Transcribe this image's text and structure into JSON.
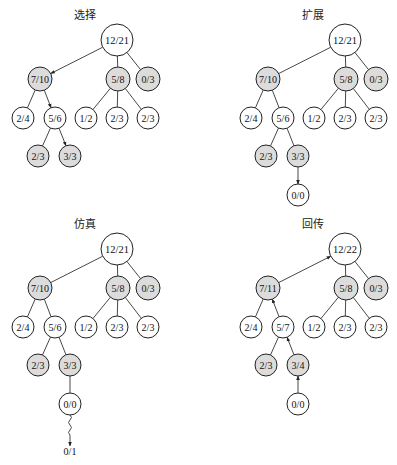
{
  "colors": {
    "shaded": "#dcdcdc",
    "plain": "#ffffff",
    "stroke": "#222222",
    "edge": "#333333"
  },
  "panels": [
    {
      "id": "selection",
      "title": "选择",
      "offset": [
        0,
        0
      ],
      "nodes": [
        {
          "id": "root",
          "label": "12/21",
          "x": 117,
          "y": 40,
          "r": 16,
          "shaded": false
        },
        {
          "id": "a",
          "label": "7/10",
          "x": 40,
          "y": 79,
          "r": 12,
          "shaded": true
        },
        {
          "id": "b",
          "label": "5/8",
          "x": 118,
          "y": 79,
          "r": 12,
          "shaded": true
        },
        {
          "id": "c",
          "label": "0/3",
          "x": 148,
          "y": 79,
          "r": 12,
          "shaded": true
        },
        {
          "id": "a1",
          "label": "2/4",
          "x": 23,
          "y": 118,
          "r": 11,
          "shaded": false
        },
        {
          "id": "a2",
          "label": "5/6",
          "x": 55,
          "y": 118,
          "r": 11,
          "shaded": false
        },
        {
          "id": "b1",
          "label": "1/2",
          "x": 86,
          "y": 118,
          "r": 11,
          "shaded": false
        },
        {
          "id": "b2",
          "label": "2/3",
          "x": 117,
          "y": 118,
          "r": 11,
          "shaded": false
        },
        {
          "id": "b3",
          "label": "2/3",
          "x": 148,
          "y": 118,
          "r": 11,
          "shaded": false
        },
        {
          "id": "a21",
          "label": "2/3",
          "x": 38,
          "y": 156,
          "r": 11,
          "shaded": true
        },
        {
          "id": "a22",
          "label": "3/3",
          "x": 70,
          "y": 156,
          "r": 11,
          "shaded": true
        }
      ],
      "edges": [
        {
          "from": "root",
          "to": "a",
          "arrow": "to"
        },
        {
          "from": "root",
          "to": "b",
          "arrow": "none"
        },
        {
          "from": "root",
          "to": "c",
          "arrow": "none"
        },
        {
          "from": "a",
          "to": "a1",
          "arrow": "none"
        },
        {
          "from": "a",
          "to": "a2",
          "arrow": "to"
        },
        {
          "from": "b",
          "to": "b1",
          "arrow": "none"
        },
        {
          "from": "b",
          "to": "b2",
          "arrow": "none"
        },
        {
          "from": "b",
          "to": "b3",
          "arrow": "none"
        },
        {
          "from": "a2",
          "to": "a21",
          "arrow": "none"
        },
        {
          "from": "a2",
          "to": "a22",
          "arrow": "to"
        }
      ]
    },
    {
      "id": "expansion",
      "title": "扩展",
      "offset": [
        228,
        0
      ],
      "nodes": [
        {
          "id": "root",
          "label": "12/21",
          "x": 117,
          "y": 40,
          "r": 16,
          "shaded": false
        },
        {
          "id": "a",
          "label": "7/10",
          "x": 40,
          "y": 79,
          "r": 12,
          "shaded": true
        },
        {
          "id": "b",
          "label": "5/8",
          "x": 118,
          "y": 79,
          "r": 12,
          "shaded": true
        },
        {
          "id": "c",
          "label": "0/3",
          "x": 148,
          "y": 79,
          "r": 12,
          "shaded": true
        },
        {
          "id": "a1",
          "label": "2/4",
          "x": 23,
          "y": 118,
          "r": 11,
          "shaded": false
        },
        {
          "id": "a2",
          "label": "5/6",
          "x": 55,
          "y": 118,
          "r": 11,
          "shaded": false
        },
        {
          "id": "b1",
          "label": "1/2",
          "x": 86,
          "y": 118,
          "r": 11,
          "shaded": false
        },
        {
          "id": "b2",
          "label": "2/3",
          "x": 117,
          "y": 118,
          "r": 11,
          "shaded": false
        },
        {
          "id": "b3",
          "label": "2/3",
          "x": 148,
          "y": 118,
          "r": 11,
          "shaded": false
        },
        {
          "id": "a21",
          "label": "2/3",
          "x": 38,
          "y": 156,
          "r": 11,
          "shaded": true
        },
        {
          "id": "a22",
          "label": "3/3",
          "x": 70,
          "y": 156,
          "r": 11,
          "shaded": true
        },
        {
          "id": "new",
          "label": "0/0",
          "x": 70,
          "y": 195,
          "r": 11,
          "shaded": false
        }
      ],
      "edges": [
        {
          "from": "root",
          "to": "a",
          "arrow": "none"
        },
        {
          "from": "root",
          "to": "b",
          "arrow": "none"
        },
        {
          "from": "root",
          "to": "c",
          "arrow": "none"
        },
        {
          "from": "a",
          "to": "a1",
          "arrow": "none"
        },
        {
          "from": "a",
          "to": "a2",
          "arrow": "none"
        },
        {
          "from": "b",
          "to": "b1",
          "arrow": "none"
        },
        {
          "from": "b",
          "to": "b2",
          "arrow": "none"
        },
        {
          "from": "b",
          "to": "b3",
          "arrow": "none"
        },
        {
          "from": "a2",
          "to": "a21",
          "arrow": "none"
        },
        {
          "from": "a2",
          "to": "a22",
          "arrow": "none"
        },
        {
          "from": "a22",
          "to": "new",
          "arrow": "to"
        }
      ]
    },
    {
      "id": "simulation",
      "title": "仿真",
      "offset": [
        0,
        209
      ],
      "nodes": [
        {
          "id": "root",
          "label": "12/21",
          "x": 117,
          "y": 40,
          "r": 16,
          "shaded": false
        },
        {
          "id": "a",
          "label": "7/10",
          "x": 40,
          "y": 79,
          "r": 12,
          "shaded": true
        },
        {
          "id": "b",
          "label": "5/8",
          "x": 118,
          "y": 79,
          "r": 12,
          "shaded": true
        },
        {
          "id": "c",
          "label": "0/3",
          "x": 148,
          "y": 79,
          "r": 12,
          "shaded": true
        },
        {
          "id": "a1",
          "label": "2/4",
          "x": 23,
          "y": 118,
          "r": 11,
          "shaded": false
        },
        {
          "id": "a2",
          "label": "5/6",
          "x": 55,
          "y": 118,
          "r": 11,
          "shaded": false
        },
        {
          "id": "b1",
          "label": "1/2",
          "x": 86,
          "y": 118,
          "r": 11,
          "shaded": false
        },
        {
          "id": "b2",
          "label": "2/3",
          "x": 117,
          "y": 118,
          "r": 11,
          "shaded": false
        },
        {
          "id": "b3",
          "label": "2/3",
          "x": 148,
          "y": 118,
          "r": 11,
          "shaded": false
        },
        {
          "id": "a21",
          "label": "2/3",
          "x": 38,
          "y": 156,
          "r": 11,
          "shaded": true
        },
        {
          "id": "a22",
          "label": "3/3",
          "x": 70,
          "y": 156,
          "r": 11,
          "shaded": true
        },
        {
          "id": "new",
          "label": "0/0",
          "x": 70,
          "y": 195,
          "r": 11,
          "shaded": false
        }
      ],
      "edges": [
        {
          "from": "root",
          "to": "a",
          "arrow": "none"
        },
        {
          "from": "root",
          "to": "b",
          "arrow": "none"
        },
        {
          "from": "root",
          "to": "c",
          "arrow": "none"
        },
        {
          "from": "a",
          "to": "a1",
          "arrow": "none"
        },
        {
          "from": "a",
          "to": "a2",
          "arrow": "none"
        },
        {
          "from": "b",
          "to": "b1",
          "arrow": "none"
        },
        {
          "from": "b",
          "to": "b2",
          "arrow": "none"
        },
        {
          "from": "b",
          "to": "b3",
          "arrow": "none"
        },
        {
          "from": "a2",
          "to": "a21",
          "arrow": "none"
        },
        {
          "from": "a2",
          "to": "a22",
          "arrow": "none"
        },
        {
          "from": "a22",
          "to": "new",
          "arrow": "none"
        }
      ],
      "rollout": {
        "from": "new",
        "label": "0/1",
        "end_y": 237,
        "label_y": 246
      }
    },
    {
      "id": "backpropagation",
      "title": "回传",
      "offset": [
        228,
        209
      ],
      "nodes": [
        {
          "id": "root",
          "label": "12/22",
          "x": 117,
          "y": 40,
          "r": 16,
          "shaded": false
        },
        {
          "id": "a",
          "label": "7/11",
          "x": 40,
          "y": 79,
          "r": 12,
          "shaded": true
        },
        {
          "id": "b",
          "label": "5/8",
          "x": 118,
          "y": 79,
          "r": 12,
          "shaded": true
        },
        {
          "id": "c",
          "label": "0/3",
          "x": 148,
          "y": 79,
          "r": 12,
          "shaded": true
        },
        {
          "id": "a1",
          "label": "2/4",
          "x": 23,
          "y": 118,
          "r": 11,
          "shaded": false
        },
        {
          "id": "a2",
          "label": "5/7",
          "x": 55,
          "y": 118,
          "r": 11,
          "shaded": false
        },
        {
          "id": "b1",
          "label": "1/2",
          "x": 86,
          "y": 118,
          "r": 11,
          "shaded": false
        },
        {
          "id": "b2",
          "label": "2/3",
          "x": 117,
          "y": 118,
          "r": 11,
          "shaded": false
        },
        {
          "id": "b3",
          "label": "2/3",
          "x": 148,
          "y": 118,
          "r": 11,
          "shaded": false
        },
        {
          "id": "a21",
          "label": "2/3",
          "x": 38,
          "y": 156,
          "r": 11,
          "shaded": true
        },
        {
          "id": "a22",
          "label": "3/4",
          "x": 70,
          "y": 156,
          "r": 11,
          "shaded": true
        },
        {
          "id": "new",
          "label": "0/0",
          "x": 70,
          "y": 195,
          "r": 11,
          "shaded": false
        }
      ],
      "edges": [
        {
          "from": "root",
          "to": "a",
          "arrow": "from"
        },
        {
          "from": "root",
          "to": "b",
          "arrow": "none"
        },
        {
          "from": "root",
          "to": "c",
          "arrow": "none"
        },
        {
          "from": "a",
          "to": "a1",
          "arrow": "none"
        },
        {
          "from": "a",
          "to": "a2",
          "arrow": "from"
        },
        {
          "from": "b",
          "to": "b1",
          "arrow": "none"
        },
        {
          "from": "b",
          "to": "b2",
          "arrow": "none"
        },
        {
          "from": "b",
          "to": "b3",
          "arrow": "none"
        },
        {
          "from": "a2",
          "to": "a21",
          "arrow": "none"
        },
        {
          "from": "a2",
          "to": "a22",
          "arrow": "from"
        },
        {
          "from": "a22",
          "to": "new",
          "arrow": "from"
        }
      ]
    }
  ],
  "title_pos": {
    "x": 85,
    "y": 19
  }
}
